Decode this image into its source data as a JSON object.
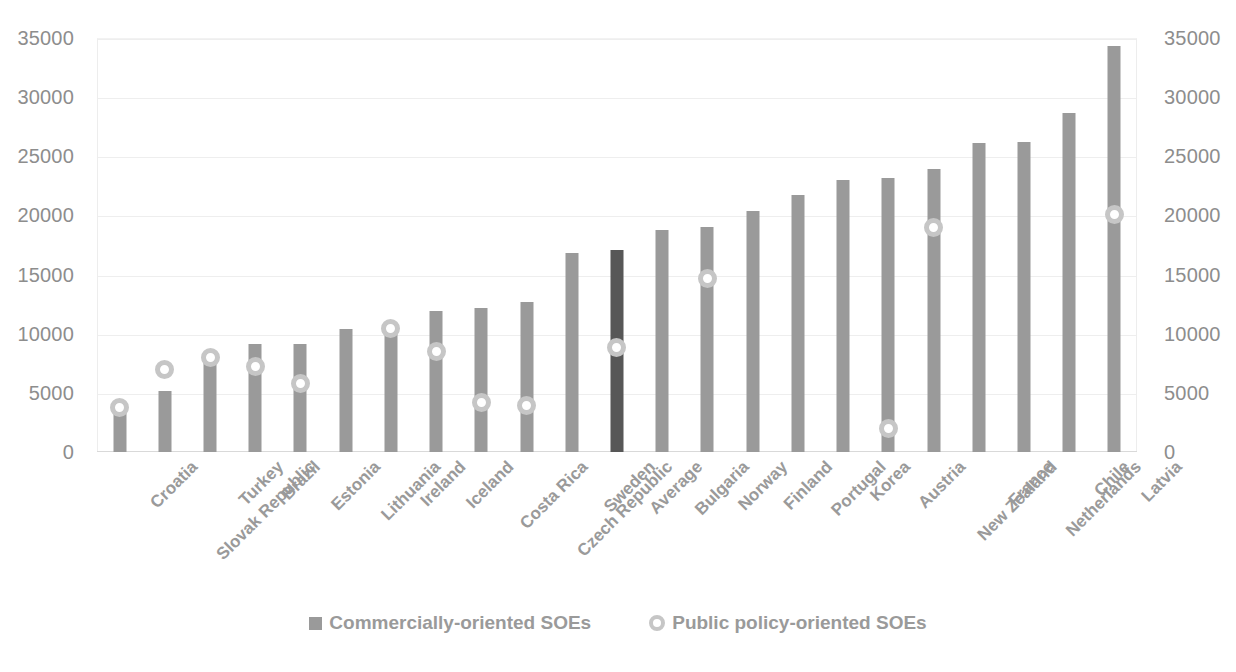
{
  "chart_data": {
    "type": "bar",
    "title": "",
    "subtitle": "",
    "xlabel": "",
    "ylabel": "",
    "ylim": [
      0,
      35000
    ],
    "y_tick_step": 5000,
    "y_ticks": [
      "0",
      "5000",
      "10000",
      "15000",
      "20000",
      "25000",
      "30000",
      "35000"
    ],
    "grid": true,
    "dual_y_axis": true,
    "legend_position": "bottom",
    "highlight_category": "Average",
    "colors": {
      "bar": "#9a9a9a",
      "bar_highlight": "#575757",
      "marker_ring": "#c6c6c6",
      "marker_fill": "#ffffff",
      "text": "#9a9a9a",
      "tick_text": "#8d8d8d",
      "gridline": "#eeeeee"
    },
    "categories": [
      "Croatia",
      "Slovak Republic",
      "Turkey",
      "Brazil",
      "Estonia",
      "Lithuania",
      "Ireland",
      "Iceland",
      "Costa Rica",
      "Czech Republic",
      "Sweden",
      "Average",
      "Bulgaria",
      "Norway",
      "Finland",
      "Portugal",
      "Korea",
      "Austria",
      "New Zealand",
      "France",
      "Netherlands",
      "Chile",
      "Latvia"
    ],
    "series": [
      {
        "name": "Commercially-oriented SOEs",
        "marker": "square",
        "type": "bar",
        "values": [
          3500,
          5200,
          8000,
          9100,
          9100,
          10400,
          10500,
          11900,
          12200,
          12700,
          16800,
          17100,
          18800,
          19000,
          20400,
          21700,
          23000,
          23200,
          23900,
          26100,
          26200,
          28700,
          34300
        ]
      },
      {
        "name": "Public policy-oriented SOEs",
        "marker": "circle",
        "type": "scatter",
        "values": [
          3800,
          7000,
          8000,
          7200,
          5800,
          null,
          10450,
          8500,
          4200,
          3950,
          null,
          8800,
          null,
          14700,
          null,
          null,
          null,
          2000,
          19000,
          null,
          null,
          null,
          20100
        ]
      }
    ]
  },
  "legend": {
    "items": [
      {
        "label": "Commercially-oriented SOEs",
        "marker": "square"
      },
      {
        "label": "Public policy-oriented SOEs",
        "marker": "circle"
      }
    ]
  }
}
